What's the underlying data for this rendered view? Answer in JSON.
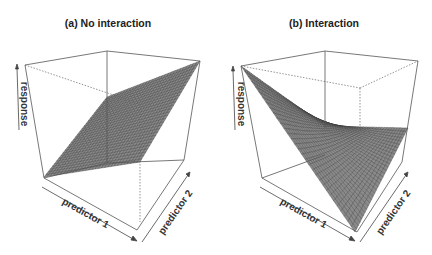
{
  "panels": [
    {
      "title": "(a) No interaction",
      "x_label": "predictor 1",
      "y_label": "predictor 2",
      "z_label": "response",
      "surface": "planar (additive effects)"
    },
    {
      "title": "(b) Interaction",
      "x_label": "predictor 1",
      "y_label": "predictor 2",
      "z_label": "response",
      "surface": "saddle / twisted (interaction effect)"
    }
  ],
  "colors": {
    "mesh_fill": "#8a8a8a",
    "mesh_line": "#3a3a3a",
    "box": "#555555",
    "background": "#ffffff"
  },
  "chart_data": [
    {
      "type": "surface",
      "title": "(a) No interaction",
      "xlabel": "predictor 1",
      "ylabel": "predictor 2",
      "zlabel": "response",
      "model": "response = b1*predictor1 + b2*predictor2",
      "ticks": "none"
    },
    {
      "type": "surface",
      "title": "(b) Interaction",
      "xlabel": "predictor 1",
      "ylabel": "predictor 2",
      "zlabel": "response",
      "model": "response = b1*predictor1 + b2*predictor2 + b3*predictor1*predictor2",
      "ticks": "none"
    }
  ]
}
